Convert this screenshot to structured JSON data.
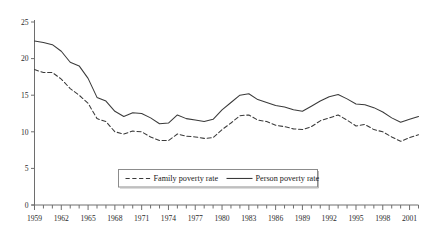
{
  "chart_data": {
    "type": "line",
    "title": "",
    "xlabel": "",
    "ylabel": "",
    "ylim": [
      0,
      25
    ],
    "ytick_values": [
      0,
      5,
      10,
      15,
      20,
      25
    ],
    "ytick_labels": [
      "0",
      "5",
      "10",
      "15",
      "20",
      "25"
    ],
    "xlim": [
      1959,
      2002
    ],
    "grid": false,
    "legend_position": "bottom-center",
    "x": [
      1959,
      1960,
      1961,
      1962,
      1963,
      1964,
      1965,
      1966,
      1967,
      1968,
      1969,
      1970,
      1971,
      1972,
      1973,
      1974,
      1975,
      1976,
      1977,
      1978,
      1979,
      1980,
      1981,
      1982,
      1983,
      1984,
      1985,
      1986,
      1987,
      1988,
      1989,
      1990,
      1991,
      1992,
      1993,
      1994,
      1995,
      1996,
      1997,
      1998,
      1999,
      2000,
      2001,
      2002
    ],
    "xtick_labels": [
      "1959",
      "1962",
      "1965",
      "1968",
      "1971",
      "1974",
      "1977",
      "1980",
      "1983",
      "1986",
      "1989",
      "1992",
      "1995",
      "1998",
      "2001"
    ],
    "xtick_values": [
      1959,
      1962,
      1965,
      1968,
      1971,
      1974,
      1977,
      1980,
      1983,
      1986,
      1989,
      1992,
      1995,
      1998,
      2001
    ],
    "series": [
      {
        "name": "Family poverty rate",
        "style": "dashed",
        "color": "#3a3a3a",
        "values": [
          18.5,
          18.1,
          18.1,
          17.2,
          15.9,
          15.0,
          13.9,
          11.8,
          11.4,
          10.0,
          9.7,
          10.1,
          10.0,
          9.3,
          8.8,
          8.8,
          9.7,
          9.4,
          9.3,
          9.1,
          9.2,
          10.3,
          11.2,
          12.2,
          12.3,
          11.6,
          11.4,
          10.9,
          10.7,
          10.4,
          10.3,
          10.7,
          11.5,
          11.9,
          12.3,
          11.6,
          10.8,
          11.0,
          10.3,
          10.0,
          9.3,
          8.7,
          9.2,
          9.6
        ]
      },
      {
        "name": "Person poverty rate",
        "style": "solid",
        "color": "#3a3a3a",
        "values": [
          22.4,
          22.2,
          21.9,
          21.0,
          19.5,
          19.0,
          17.3,
          14.7,
          14.2,
          12.8,
          12.1,
          12.6,
          12.5,
          11.9,
          11.1,
          11.2,
          12.3,
          11.8,
          11.6,
          11.4,
          11.7,
          13.0,
          14.0,
          15.0,
          15.2,
          14.4,
          14.0,
          13.6,
          13.4,
          13.0,
          12.8,
          13.5,
          14.2,
          14.8,
          15.1,
          14.5,
          13.8,
          13.7,
          13.3,
          12.7,
          11.9,
          11.3,
          11.7,
          12.1
        ]
      }
    ]
  },
  "legend": {
    "family_label": "Family poverty rate",
    "person_label": "Person poverty rate"
  }
}
